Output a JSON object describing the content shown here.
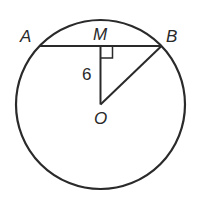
{
  "diagram": {
    "type": "circle-geometry",
    "stroke_color": "#2a2a2a",
    "background": "#ffffff",
    "circle": {
      "center_label": "O",
      "cx": 100.5,
      "cy": 104.5,
      "r": 84.5
    },
    "points": {
      "A": {
        "label": "A",
        "x": 39.5,
        "y": 46
      },
      "M": {
        "label": "M",
        "x": 100.5,
        "y": 46
      },
      "B": {
        "label": "B",
        "x": 161.5,
        "y": 46
      },
      "O": {
        "label": "O",
        "x": 100.5,
        "y": 104.5
      }
    },
    "segments": [
      {
        "name": "chord-AB",
        "from": "A",
        "to": "B"
      },
      {
        "name": "segment-MO",
        "from": "M",
        "to": "O"
      },
      {
        "name": "segment-BO",
        "from": "B",
        "to": "O"
      }
    ],
    "right_angle_marker": {
      "at": "M",
      "size": 12
    },
    "measurements": {
      "MO": "6"
    }
  }
}
